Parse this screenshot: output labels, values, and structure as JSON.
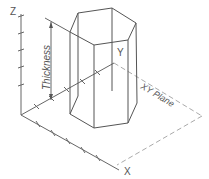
{
  "diagram": {
    "axes": {
      "x_label": "X",
      "y_label": "Y",
      "z_label": "Z"
    },
    "dimension_label": "Thickness",
    "plane_label": "XY Plane",
    "colors": {
      "stroke": "#555555",
      "axis": "#666666",
      "plane_dash": "#aaaaaa",
      "background": "#ffffff"
    }
  }
}
